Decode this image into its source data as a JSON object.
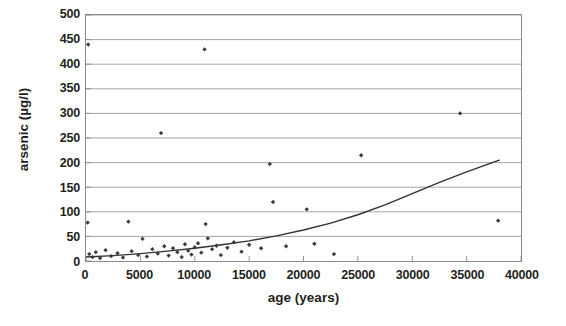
{
  "chart_data": {
    "type": "scatter",
    "title": "",
    "xlabel": "age (years)",
    "ylabel": "arsenic (µg/l)",
    "xlim": [
      0,
      40000
    ],
    "ylim": [
      0,
      500
    ],
    "xticks": [
      0,
      5000,
      10000,
      15000,
      20000,
      25000,
      30000,
      35000,
      40000
    ],
    "yticks": [
      0,
      50,
      100,
      150,
      200,
      250,
      300,
      350,
      400,
      450,
      500
    ],
    "xtick_labels": [
      "0",
      "5000",
      "10000",
      "15000",
      "20000",
      "25000",
      "30000",
      "35000",
      "40000"
    ],
    "ytick_labels": [
      "0",
      "50",
      "100",
      "150",
      "200",
      "250",
      "300",
      "350",
      "400",
      "450",
      "500"
    ],
    "grid": "horizontal",
    "legend": "none",
    "marker": "small filled diamond",
    "marker_color": "#3b3b3b",
    "grid_color": "#9a9a9a",
    "axis_color": "#8a8a8a",
    "series": [
      {
        "name": "samples",
        "type": "scatter",
        "points": [
          [
            200,
            440
          ],
          [
            150,
            78
          ],
          [
            3900,
            80
          ],
          [
            300,
            14
          ],
          [
            600,
            8
          ],
          [
            900,
            18
          ],
          [
            1300,
            6
          ],
          [
            1800,
            22
          ],
          [
            2300,
            10
          ],
          [
            2900,
            16
          ],
          [
            3400,
            7
          ],
          [
            4200,
            20
          ],
          [
            4800,
            12
          ],
          [
            5200,
            45
          ],
          [
            5600,
            9
          ],
          [
            6100,
            24
          ],
          [
            6600,
            15
          ],
          [
            6900,
            260
          ],
          [
            7200,
            30
          ],
          [
            7600,
            11
          ],
          [
            8000,
            26
          ],
          [
            8400,
            18
          ],
          [
            8800,
            8
          ],
          [
            9100,
            34
          ],
          [
            9400,
            21
          ],
          [
            9700,
            13
          ],
          [
            10000,
            28
          ],
          [
            10300,
            36
          ],
          [
            10600,
            17
          ],
          [
            10900,
            430
          ],
          [
            11000,
            75
          ],
          [
            11200,
            46
          ],
          [
            11600,
            24
          ],
          [
            12000,
            31
          ],
          [
            12400,
            12
          ],
          [
            13000,
            27
          ],
          [
            13600,
            38
          ],
          [
            14300,
            19
          ],
          [
            15000,
            33
          ],
          [
            16100,
            26
          ],
          [
            16900,
            197
          ],
          [
            17200,
            120
          ],
          [
            18400,
            30
          ],
          [
            20300,
            105
          ],
          [
            21000,
            35
          ],
          [
            22800,
            14
          ],
          [
            25300,
            215
          ],
          [
            34400,
            300
          ],
          [
            37900,
            82
          ]
        ]
      },
      {
        "name": "fitted trend",
        "type": "line",
        "points": [
          [
            0,
            8
          ],
          [
            2500,
            11
          ],
          [
            5000,
            15
          ],
          [
            7500,
            20
          ],
          [
            10000,
            26
          ],
          [
            12500,
            33
          ],
          [
            15000,
            41
          ],
          [
            17500,
            51
          ],
          [
            20000,
            63
          ],
          [
            22500,
            77
          ],
          [
            25000,
            94
          ],
          [
            27500,
            114
          ],
          [
            30000,
            137
          ],
          [
            32500,
            160
          ],
          [
            35000,
            181
          ],
          [
            38000,
            205
          ]
        ]
      }
    ]
  }
}
